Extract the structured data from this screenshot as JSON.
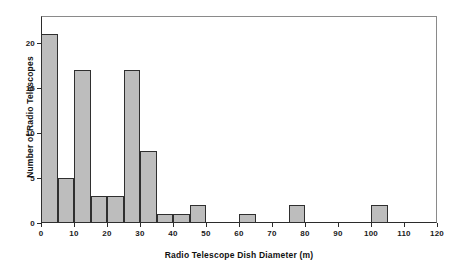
{
  "chart_data": {
    "type": "bar",
    "title": "",
    "subtitle": "",
    "xlabel": "Radio Telescope Dish Diameter (m)",
    "ylabel": "Number of Radio Telescopes",
    "xlim": [
      0,
      120
    ],
    "ylim": [
      0,
      23
    ],
    "bin_width": 5,
    "grid": false,
    "legend": null,
    "xticks": [
      0,
      10,
      20,
      30,
      40,
      50,
      60,
      70,
      80,
      90,
      100,
      110,
      120
    ],
    "xtick_labels": [
      "0",
      "10",
      "20",
      "30",
      "40",
      "50",
      "60",
      "70",
      "80",
      "90",
      "100",
      "110",
      "120"
    ],
    "yticks": [
      0,
      5,
      10,
      15,
      20
    ],
    "ytick_labels": [
      "0",
      "5",
      "10",
      "15",
      "20"
    ],
    "bin_edges": [
      0,
      5,
      10,
      15,
      20,
      25,
      30,
      35,
      40,
      45,
      50,
      55,
      60,
      65,
      70,
      75,
      80,
      85,
      90,
      95,
      100,
      105,
      110,
      115,
      120
    ],
    "values": [
      21,
      5,
      17,
      3,
      3,
      17,
      8,
      1,
      1,
      2,
      0,
      1,
      0,
      0,
      2,
      0,
      0,
      0,
      0,
      0,
      2,
      0,
      0,
      0
    ],
    "bars": [
      {
        "label": "0-5",
        "x0": 0,
        "x1": 5,
        "value": 21
      },
      {
        "label": "5-10",
        "x0": 5,
        "x1": 10,
        "value": 5
      },
      {
        "label": "10-15",
        "x0": 10,
        "x1": 15,
        "value": 17
      },
      {
        "label": "15-20",
        "x0": 15,
        "x1": 20,
        "value": 3
      },
      {
        "label": "20-25",
        "x0": 20,
        "x1": 25,
        "value": 3
      },
      {
        "label": "25-30",
        "x0": 25,
        "x1": 30,
        "value": 17
      },
      {
        "label": "30-35",
        "x0": 30,
        "x1": 35,
        "value": 8
      },
      {
        "label": "35-40",
        "x0": 35,
        "x1": 40,
        "value": 1
      },
      {
        "label": "40-45",
        "x0": 40,
        "x1": 45,
        "value": 1
      },
      {
        "label": "45-50",
        "x0": 45,
        "x1": 50,
        "value": 2
      },
      {
        "label": "60-65",
        "x0": 60,
        "x1": 65,
        "value": 1
      },
      {
        "label": "75-80",
        "x0": 75,
        "x1": 80,
        "value": 2
      },
      {
        "label": "100-105",
        "x0": 100,
        "x1": 105,
        "value": 2
      }
    ],
    "colors": {
      "bar_fill": "#bdbdbd",
      "bar_edge": "#2f2f2f",
      "axis": "#2b2b2b",
      "frame": "#8a8a8a",
      "background": "#ffffff",
      "text": "#1a1a1a"
    }
  }
}
